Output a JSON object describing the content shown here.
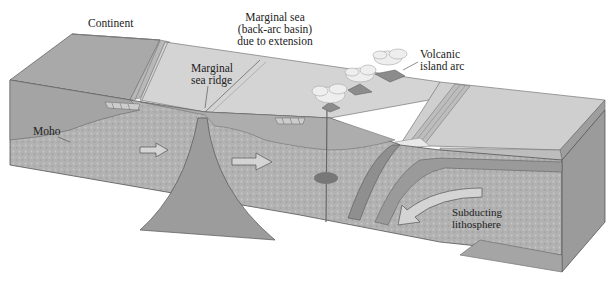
{
  "diagram": {
    "type": "geological block diagram",
    "labels": {
      "continent": "Continent",
      "marginal_sea_line1": "Marginal sea",
      "marginal_sea_line2": "(back-arc basin)",
      "marginal_sea_line3": "due to extension",
      "volcanic_arc_line1": "Volcanic",
      "volcanic_arc_line2": "island arc",
      "ridge_line1": "Marginal",
      "ridge_line2": "sea ridge",
      "moho": "Moho",
      "subducting_line1": "Subducting",
      "subducting_line2": "lithosphere"
    },
    "colors": {
      "top_surface": "#c9c9c9",
      "sea_floor": "#d6d6d6",
      "front_face": "#a8a8a8",
      "mantle": "#9a9a9a",
      "textured": "#b4b4b4",
      "arrow_fill": "#d0d0d0",
      "outline": "#555555",
      "cloud": "#eeeeee"
    }
  }
}
